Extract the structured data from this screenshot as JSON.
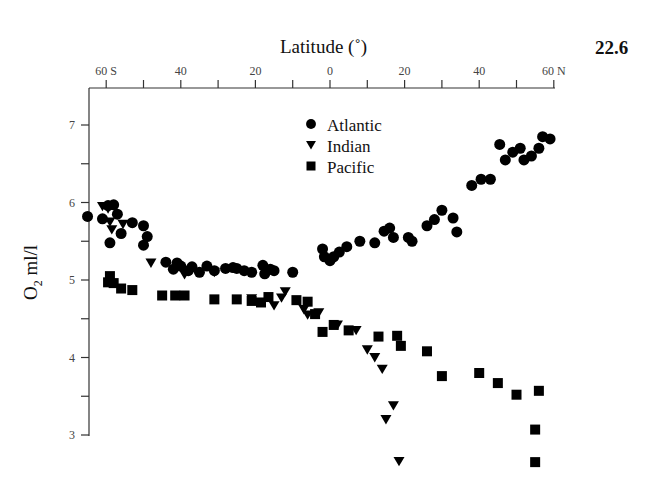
{
  "figure": {
    "number": "22.6",
    "x_title": "Latitude (˚)",
    "y_title_main": "O",
    "y_title_sub": "2",
    "y_title_unit": " ml/l"
  },
  "legend": [
    {
      "label": "Atlantic",
      "marker": "circle"
    },
    {
      "label": "Indian",
      "marker": "triangle-down"
    },
    {
      "label": "Pacific",
      "marker": "square"
    }
  ],
  "chart_data": {
    "type": "scatter",
    "title": "",
    "xlabel": "Latitude (˚)",
    "ylabel": "O2 ml/l",
    "x_tick_labels": [
      "60 S",
      "40",
      "20",
      "0",
      "20",
      "40",
      "60 N"
    ],
    "x_ticks": [
      -60,
      -40,
      -20,
      0,
      20,
      40,
      60
    ],
    "x_minor_ticks": [
      -50,
      -30,
      -10,
      10,
      30,
      50
    ],
    "y_tick_labels": [
      "3",
      "4",
      "5",
      "6",
      "7"
    ],
    "y_ticks": [
      3,
      4,
      5,
      6,
      7
    ],
    "y_minor_ticks": [
      3.5,
      4.5,
      5.5,
      6.5
    ],
    "xlim": [
      -65,
      60
    ],
    "ylim": [
      2.6,
      7.5
    ],
    "x_axis_position": "top",
    "grid": false,
    "legend_position": "upper center",
    "series": [
      {
        "name": "Atlantic",
        "marker": "circle",
        "points": [
          [
            -65,
            5.82
          ],
          [
            -61,
            5.79
          ],
          [
            -59,
            5.48
          ],
          [
            -59.5,
            5.96
          ],
          [
            -58,
            5.97
          ],
          [
            -57,
            5.85
          ],
          [
            -56,
            5.6
          ],
          [
            -53,
            5.74
          ],
          [
            -50,
            5.7
          ],
          [
            -50,
            5.45
          ],
          [
            -49,
            5.56
          ],
          [
            -44,
            5.23
          ],
          [
            -42,
            5.14
          ],
          [
            -41,
            5.22
          ],
          [
            -40,
            5.18
          ],
          [
            -38,
            5.12
          ],
          [
            -37,
            5.17
          ],
          [
            -35,
            5.1
          ],
          [
            -33,
            5.18
          ],
          [
            -31,
            5.12
          ],
          [
            -28,
            5.15
          ],
          [
            -26,
            5.16
          ],
          [
            -25,
            5.15
          ],
          [
            -23,
            5.12
          ],
          [
            -21,
            5.1
          ],
          [
            -18,
            5.19
          ],
          [
            -17.5,
            5.08
          ],
          [
            -16,
            5.14
          ],
          [
            -15,
            5.12
          ],
          [
            -10,
            5.1
          ],
          [
            -2,
            5.4
          ],
          [
            -1.5,
            5.3
          ],
          [
            0,
            5.25
          ],
          [
            1,
            5.3
          ],
          [
            2.5,
            5.36
          ],
          [
            4.5,
            5.43
          ],
          [
            8,
            5.5
          ],
          [
            12,
            5.48
          ],
          [
            14.5,
            5.63
          ],
          [
            16,
            5.67
          ],
          [
            17,
            5.55
          ],
          [
            21,
            5.55
          ],
          [
            22,
            5.5
          ],
          [
            26,
            5.7
          ],
          [
            28,
            5.78
          ],
          [
            30,
            5.9
          ],
          [
            33,
            5.8
          ],
          [
            34,
            5.62
          ],
          [
            38,
            6.22
          ],
          [
            40.5,
            6.3
          ],
          [
            43,
            6.3
          ],
          [
            45.5,
            6.75
          ],
          [
            47,
            6.55
          ],
          [
            49,
            6.65
          ],
          [
            51,
            6.7
          ],
          [
            52,
            6.55
          ],
          [
            54,
            6.6
          ],
          [
            56,
            6.7
          ],
          [
            57,
            6.85
          ],
          [
            59,
            6.82
          ]
        ]
      },
      {
        "name": "Indian",
        "marker": "triangle-down",
        "points": [
          [
            -61,
            5.95
          ],
          [
            -59.5,
            5.92
          ],
          [
            -59,
            5.75
          ],
          [
            -58.5,
            5.65
          ],
          [
            -55.5,
            5.72
          ],
          [
            -48,
            5.22
          ],
          [
            -39,
            5.07
          ],
          [
            -31,
            5.1
          ],
          [
            -21,
            4.76
          ],
          [
            -15,
            4.67
          ],
          [
            -13,
            4.77
          ],
          [
            -12,
            4.85
          ],
          [
            -7,
            4.62
          ],
          [
            -6,
            4.55
          ],
          [
            -3,
            4.58
          ],
          [
            2,
            4.42
          ],
          [
            7,
            4.35
          ],
          [
            10,
            4.1
          ],
          [
            12,
            4.0
          ],
          [
            14,
            3.85
          ],
          [
            15,
            3.2
          ],
          [
            17,
            3.38
          ],
          [
            18.5,
            2.66
          ]
        ]
      },
      {
        "name": "Pacific",
        "marker": "square",
        "points": [
          [
            -59.5,
            4.97
          ],
          [
            -59,
            5.05
          ],
          [
            -58,
            4.96
          ],
          [
            -56,
            4.89
          ],
          [
            -53,
            4.87
          ],
          [
            -45,
            4.8
          ],
          [
            -41.5,
            4.8
          ],
          [
            -39,
            4.8
          ],
          [
            -31,
            4.75
          ],
          [
            -25,
            4.75
          ],
          [
            -21,
            4.73
          ],
          [
            -18.5,
            4.71
          ],
          [
            -16.5,
            4.78
          ],
          [
            -9,
            4.74
          ],
          [
            -6,
            4.72
          ],
          [
            -4,
            4.56
          ],
          [
            -2,
            4.33
          ],
          [
            1,
            4.42
          ],
          [
            5,
            4.35
          ],
          [
            13,
            4.27
          ],
          [
            18,
            4.28
          ],
          [
            19,
            4.15
          ],
          [
            26,
            4.08
          ],
          [
            30,
            3.76
          ],
          [
            40,
            3.8
          ],
          [
            45,
            3.67
          ],
          [
            50,
            3.52
          ],
          [
            56,
            3.57
          ],
          [
            55,
            3.07
          ],
          [
            55,
            2.65
          ]
        ]
      }
    ]
  }
}
